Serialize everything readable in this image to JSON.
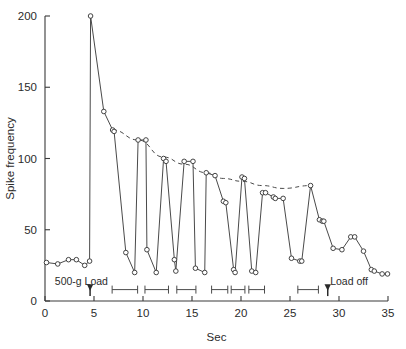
{
  "chart_data": {
    "type": "line",
    "title": "",
    "xlabel": "Sec",
    "ylabel": "Spike frequency",
    "xlim": [
      0,
      35
    ],
    "ylim": [
      0,
      200
    ],
    "xticks": [
      0,
      5,
      10,
      15,
      20,
      25,
      30,
      35
    ],
    "xticklabels": [
      "0",
      "5",
      "10",
      "15",
      "20",
      "25",
      "30",
      "35"
    ],
    "yticks": [
      0,
      50,
      100,
      150,
      200
    ],
    "yticklabels": [
      "0",
      "50",
      "100",
      "150",
      "200"
    ],
    "grid": false,
    "legend": "none",
    "markers": "open-circle",
    "series": [
      {
        "name": "Spike frequency",
        "style": "solid-with-open-circle-markers",
        "x": [
          0.15,
          1.3,
          2.4,
          3.2,
          4.05,
          4.55,
          4.65,
          6.0,
          6.9,
          7.05,
          8.25,
          9.15,
          9.5,
          10.3,
          10.4,
          11.35,
          12.1,
          12.35,
          13.2,
          13.35,
          14.2,
          15.1,
          15.35,
          16.3,
          16.45,
          17.35,
          18.2,
          18.45,
          19.25,
          19.4,
          20.1,
          20.35,
          21.1,
          21.5,
          22.2,
          22.5,
          23.3,
          23.5,
          24.3,
          25.15,
          26.0,
          26.2,
          27.1,
          28.0,
          28.3,
          28.45,
          29.4,
          30.3,
          31.2,
          31.6,
          32.5,
          33.3,
          33.6,
          34.4,
          34.95
        ],
        "y": [
          27,
          26,
          29,
          29,
          25,
          28,
          200,
          133,
          120,
          119,
          34,
          20,
          113,
          113,
          36,
          20,
          100,
          98,
          29,
          21,
          98,
          98,
          23,
          20,
          90,
          88,
          70,
          69,
          22,
          20,
          87,
          86,
          21,
          20,
          76,
          76,
          73,
          72,
          72,
          30,
          28,
          28,
          81,
          57,
          56,
          56,
          37,
          36,
          45,
          45,
          35,
          22,
          21,
          19,
          19
        ]
      },
      {
        "name": "Adaptation envelope",
        "style": "dashed",
        "x": [
          6.9,
          9.5,
          12.1,
          14.2,
          16.45,
          18.2,
          20.1,
          22.2,
          24.3,
          27.1
        ],
        "y": [
          120,
          113,
          101,
          96,
          90,
          86,
          84,
          81,
          79,
          81
        ]
      }
    ],
    "annotations": [
      {
        "name": "load-on",
        "label": "500-g Load",
        "label_x": 1.0,
        "label_y": 14,
        "arrow_x": 4.6,
        "arrow_y_from": 11,
        "arrow_y_to": 1,
        "arrow_dir": "down"
      },
      {
        "name": "load-off",
        "label": "Load off",
        "label_x": 29.1,
        "label_y": 14,
        "arrow_x": 28.85,
        "arrow_y_from": 11,
        "arrow_y_to": 1,
        "arrow_dir": "down"
      }
    ],
    "interval_brackets": [
      {
        "x_start": 6.85,
        "x_end": 9.45
      },
      {
        "x_start": 10.2,
        "x_end": 12.6
      },
      {
        "x_start": 13.45,
        "x_end": 15.4
      },
      {
        "x_start": 17.0,
        "x_end": 18.65
      },
      {
        "x_start": 19.0,
        "x_end": 20.4
      },
      {
        "x_start": 20.8,
        "x_end": 22.4
      },
      {
        "x_start": 25.8,
        "x_end": 27.9
      }
    ],
    "bracket_y": 8
  },
  "style": {
    "axis_color": "#3a3a3a",
    "data_color": "#4a4a4a",
    "marker_fill": "#ffffff",
    "background": "#ffffff",
    "text_color": "#2b2b2b"
  }
}
